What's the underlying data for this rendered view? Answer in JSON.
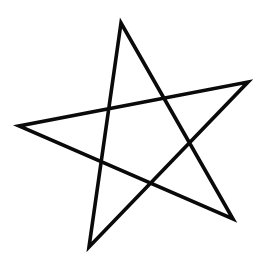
{
  "figure": {
    "background_color": "#ffffff",
    "stroke_color": "#0a0a0a",
    "stroke_width": 3.6,
    "vertices": [
      {
        "name": "top",
        "x": 121,
        "y": 23
      },
      {
        "name": "bottom-right",
        "x": 233,
        "y": 219
      },
      {
        "name": "left",
        "x": 19,
        "y": 126
      },
      {
        "name": "right",
        "x": 248,
        "y": 82
      },
      {
        "name": "bottom-left",
        "x": 89,
        "y": 247
      }
    ]
  }
}
